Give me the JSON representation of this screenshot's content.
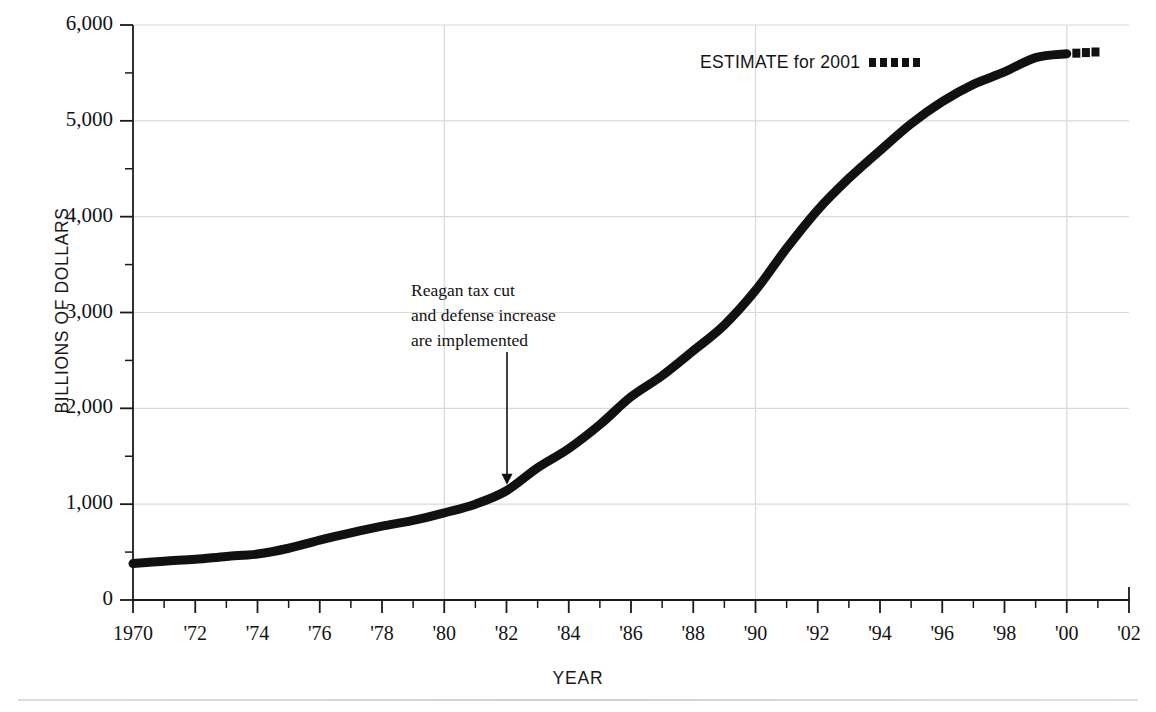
{
  "chart_data": {
    "type": "line",
    "title": "",
    "subtitle": "",
    "xlabel": "YEAR",
    "ylabel": "BILLIONS OF DOLLARS",
    "xlim": [
      1970,
      2002
    ],
    "ylim": [
      0,
      6000
    ],
    "grid": "major gridlines at 1,000 intervals on y and at 1980, 1990, 2000 on x",
    "legend_position": "top-right inside plot",
    "y_ticks": [
      0,
      1000,
      2000,
      3000,
      4000,
      5000,
      6000
    ],
    "y_tick_labels": [
      "0",
      "1,000",
      "2,000",
      "3,000",
      "4,000",
      "5,000",
      "6,000"
    ],
    "y_minor_tick_interval": 500,
    "x_ticks": [
      1970,
      1972,
      1974,
      1976,
      1978,
      1980,
      1982,
      1984,
      1986,
      1988,
      1990,
      1992,
      1994,
      1996,
      1998,
      2000,
      2002
    ],
    "x_tick_labels": [
      "1970",
      "'72",
      "'74",
      "'76",
      "'78",
      "'80",
      "'82",
      "'84",
      "'86",
      "'88",
      "'90",
      "'92",
      "'94",
      "'96",
      "'98",
      "'00",
      "'02"
    ],
    "x_minor_tick_interval": 1,
    "series": [
      {
        "name": "National debt (actual)",
        "style": "solid",
        "color": "#111111",
        "x": [
          1970,
          1971,
          1972,
          1973,
          1974,
          1975,
          1976,
          1977,
          1978,
          1979,
          1980,
          1981,
          1982,
          1983,
          1984,
          1985,
          1986,
          1987,
          1988,
          1989,
          1990,
          1991,
          1992,
          1993,
          1994,
          1995,
          1996,
          1997,
          1998,
          1999,
          2000
        ],
        "values": [
          380,
          405,
          425,
          455,
          480,
          540,
          625,
          700,
          770,
          830,
          910,
          1000,
          1140,
          1380,
          1580,
          1830,
          2120,
          2340,
          2600,
          2870,
          3230,
          3670,
          4070,
          4400,
          4690,
          4970,
          5200,
          5380,
          5510,
          5660,
          5700
        ]
      },
      {
        "name": "ESTIMATE for 2001",
        "style": "dotted",
        "color": "#111111",
        "x": [
          2000,
          2001
        ],
        "values": [
          5700,
          5720
        ]
      }
    ],
    "legend": [
      {
        "label": "ESTIMATE for 2001",
        "marker": "dotted-squares"
      }
    ],
    "annotations": [
      {
        "lines": [
          "Reagan tax cut",
          "and defense increase",
          "are implemented"
        ],
        "points_to_year": 1982,
        "points_to_value": 1140,
        "arrow": "down"
      }
    ]
  },
  "accessibility": {
    "icon_names": [
      "down-arrow-annotation-icon",
      "dotted-line-legend-icon"
    ]
  },
  "colors": {
    "line": "#111111",
    "grid": "#d9d9d9",
    "axis": "#1a1a1a",
    "text": "#121212",
    "background": "#ffffff"
  }
}
